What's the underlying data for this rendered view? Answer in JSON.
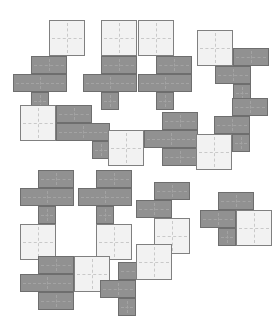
{
  "canvas": {
    "width": 271,
    "height": 313,
    "background": "#ffffff",
    "cell_size": 18,
    "light_square_size": 36
  },
  "palette": {
    "dark_fill": "#919191",
    "dark_stroke": "#6e6e6e",
    "light_fill": "#f2f2f2",
    "light_stroke": "#808080",
    "crosshair_light": "#c9c9c9",
    "crosshair_dark": "#a3a3a3"
  },
  "legend": {
    "dark_label": "dark gray unit cell",
    "light_label": "light 2x2 square tile"
  },
  "pieces": [
    {
      "id": "piece-1",
      "row": 1,
      "col": 1,
      "origin": [
        13,
        20
      ],
      "light": [
        {
          "x": 36,
          "y": 0,
          "size": 36
        }
      ],
      "dark": [
        {
          "x": 18,
          "y": 36,
          "w": 36,
          "h": 18
        },
        {
          "x": 0,
          "y": 54,
          "w": 54,
          "h": 18
        },
        {
          "x": 18,
          "y": 72,
          "w": 18,
          "h": 18
        }
      ]
    },
    {
      "id": "piece-2",
      "row": 1,
      "col": 2,
      "origin": [
        83,
        20
      ],
      "light": [
        {
          "x": 18,
          "y": 0,
          "size": 36
        }
      ],
      "dark": [
        {
          "x": 18,
          "y": 36,
          "w": 36,
          "h": 18
        },
        {
          "x": 0,
          "y": 54,
          "w": 54,
          "h": 18
        },
        {
          "x": 18,
          "y": 72,
          "w": 18,
          "h": 18
        }
      ]
    },
    {
      "id": "piece-3",
      "row": 1,
      "col": 3,
      "origin": [
        138,
        20
      ],
      "light": [
        {
          "x": 0,
          "y": 0,
          "size": 36
        }
      ],
      "dark": [
        {
          "x": 18,
          "y": 36,
          "w": 36,
          "h": 18
        },
        {
          "x": 0,
          "y": 54,
          "w": 54,
          "h": 18
        },
        {
          "x": 18,
          "y": 72,
          "w": 18,
          "h": 18
        }
      ]
    },
    {
      "id": "piece-4",
      "row": 1,
      "col": 4,
      "origin": [
        197,
        30
      ],
      "light": [
        {
          "x": 0,
          "y": 0,
          "size": 36
        }
      ],
      "dark": [
        {
          "x": 36,
          "y": 18,
          "w": 36,
          "h": 18
        },
        {
          "x": 18,
          "y": 36,
          "w": 36,
          "h": 18
        },
        {
          "x": 36,
          "y": 54,
          "w": 18,
          "h": 18
        }
      ]
    },
    {
      "id": "piece-5",
      "row": 2,
      "col": 1,
      "origin": [
        20,
        105
      ],
      "light": [
        {
          "x": 0,
          "y": 0,
          "size": 36
        }
      ],
      "dark": [
        {
          "x": 36,
          "y": 0,
          "w": 36,
          "h": 18
        },
        {
          "x": 36,
          "y": 18,
          "w": 54,
          "h": 18
        },
        {
          "x": 72,
          "y": 36,
          "w": 18,
          "h": 18
        }
      ]
    },
    {
      "id": "piece-6",
      "row": 2,
      "col": 2,
      "origin": [
        108,
        112
      ],
      "light": [
        {
          "x": 0,
          "y": 18,
          "size": 36
        }
      ],
      "dark": [
        {
          "x": 54,
          "y": 0,
          "w": 36,
          "h": 18
        },
        {
          "x": 36,
          "y": 18,
          "w": 54,
          "h": 18
        },
        {
          "x": 54,
          "y": 36,
          "w": 36,
          "h": 18
        }
      ]
    },
    {
      "id": "piece-7",
      "row": 2,
      "col": 3,
      "origin": [
        196,
        98
      ],
      "light": [
        {
          "x": 0,
          "y": 36,
          "size": 36
        }
      ],
      "dark": [
        {
          "x": 36,
          "y": 0,
          "w": 36,
          "h": 18
        },
        {
          "x": 18,
          "y": 18,
          "w": 36,
          "h": 18
        },
        {
          "x": 36,
          "y": 36,
          "w": 18,
          "h": 18
        }
      ]
    },
    {
      "id": "piece-8",
      "row": 3,
      "col": 1,
      "origin": [
        20,
        170
      ],
      "light": [
        {
          "x": 0,
          "y": 54,
          "size": 36
        }
      ],
      "dark": [
        {
          "x": 18,
          "y": 0,
          "w": 36,
          "h": 18
        },
        {
          "x": 0,
          "y": 18,
          "w": 54,
          "h": 18
        },
        {
          "x": 18,
          "y": 36,
          "w": 18,
          "h": 18
        }
      ]
    },
    {
      "id": "piece-9",
      "row": 3,
      "col": 2,
      "origin": [
        78,
        170
      ],
      "light": [
        {
          "x": 18,
          "y": 54,
          "size": 36
        }
      ],
      "dark": [
        {
          "x": 18,
          "y": 0,
          "w": 36,
          "h": 18
        },
        {
          "x": 0,
          "y": 18,
          "w": 54,
          "h": 18
        },
        {
          "x": 18,
          "y": 36,
          "w": 18,
          "h": 18
        }
      ]
    },
    {
      "id": "piece-10",
      "row": 3,
      "col": 3,
      "origin": [
        136,
        182
      ],
      "light": [
        {
          "x": 18,
          "y": 36,
          "size": 36
        }
      ],
      "dark": [
        {
          "x": 18,
          "y": 0,
          "w": 36,
          "h": 18
        },
        {
          "x": 0,
          "y": 18,
          "w": 36,
          "h": 18
        },
        {
          "x": 18,
          "y": 36,
          "w": 18,
          "h": 18
        }
      ]
    },
    {
      "id": "piece-11",
      "row": 3,
      "col": 4,
      "origin": [
        200,
        192
      ],
      "light": [
        {
          "x": 36,
          "y": 18,
          "size": 36
        }
      ],
      "dark": [
        {
          "x": 18,
          "y": 0,
          "w": 36,
          "h": 18
        },
        {
          "x": 0,
          "y": 18,
          "w": 36,
          "h": 18
        },
        {
          "x": 18,
          "y": 36,
          "w": 18,
          "h": 18
        }
      ]
    },
    {
      "id": "piece-12",
      "row": 4,
      "col": 1,
      "origin": [
        20,
        256
      ],
      "light": [
        {
          "x": 54,
          "y": 0,
          "size": 36
        }
      ],
      "dark": [
        {
          "x": 18,
          "y": 0,
          "w": 36,
          "h": 18
        },
        {
          "x": 0,
          "y": 18,
          "w": 54,
          "h": 18
        },
        {
          "x": 18,
          "y": 36,
          "w": 36,
          "h": 18
        }
      ]
    },
    {
      "id": "piece-13",
      "row": 4,
      "col": 2,
      "origin": [
        100,
        244
      ],
      "light": [
        {
          "x": 36,
          "y": 0,
          "size": 36
        }
      ],
      "dark": [
        {
          "x": 18,
          "y": 18,
          "w": 36,
          "h": 18
        },
        {
          "x": 0,
          "y": 36,
          "w": 36,
          "h": 18
        },
        {
          "x": 18,
          "y": 54,
          "w": 18,
          "h": 18
        }
      ]
    }
  ]
}
